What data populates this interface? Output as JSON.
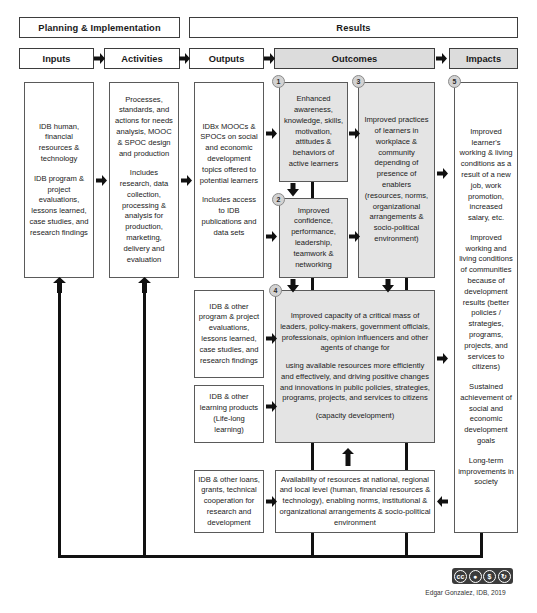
{
  "banners": {
    "planning": "Planning & Implementation",
    "results": "Results"
  },
  "columns": [
    {
      "id": "inputs",
      "label": "Inputs"
    },
    {
      "id": "activities",
      "label": "Activities"
    },
    {
      "id": "outputs",
      "label": "Outputs"
    },
    {
      "id": "outcomes",
      "label": "Outcomes"
    },
    {
      "id": "impacts",
      "label": "Impacts"
    }
  ],
  "inputs": {
    "box1_p1": "IDB human, financial resources & technology",
    "box1_p2": "IDB program & project evaluations, lessons learned, case studies, and research findings"
  },
  "activities": {
    "box1_p1": "Processes, standards, and actions for needs analysis, MOOC & SPOC design and production",
    "box1_p2": "Includes research, data collection, processing & analysis for production, marketing, delivery and evaluation"
  },
  "outputs": {
    "box1_p1": "IDBx MOOCs & SPOCs on social and economic development topics offered to potential learners",
    "box1_p2": "Includes access to IDB publications and data sets",
    "box2": "IDB & other program & project evaluations, lessons learned, case studies, and research findings",
    "box3": "IDB & other learning products (Life-long learning)",
    "box4": "IDB & other loans, grants, technical cooperation for research and development"
  },
  "outcomes": {
    "n1": "1",
    "n2": "2",
    "n3": "3",
    "n4": "4",
    "box1": "Enhanced awareness, knowledge, skills, motivation, attitudes & behaviors of active learners",
    "box2": "Improved confidence, performance, leadership, teamwork & networking",
    "box3": "Improved practices of learners in workplace & community depending of presence of enablers (resources, norms, organizational arrangements & socio-political environment)",
    "box4_p1": "Improved capacity of a critical mass of leaders, policy-makers, government officials, professionals, opinion influencers and other agents of change for",
    "box4_p2": "using available resources more efficiently and effectively, and driving positive changes and innovations in public policies, strategies, programs, projects, and services to citizens",
    "box4_p3": "(capacity development)",
    "box5": "Availability of resources at national, regional and local level (human, financial resources & technology), enabling norms, institutional & organizational arrangements & socio-political environment"
  },
  "impacts": {
    "n5": "5",
    "box1_p1": "Improved learner's working & living conditions as a result of a new job, work promotion, increased salary, etc.",
    "box1_p2": "Improved working and living conditions of communities because of development results (better policies / strategies, programs, projects, and services to citizens)",
    "box1_p3": "Sustained achievement of social and economic development goals",
    "box1_p4": "Long-term improvements in society"
  },
  "footer": {
    "credit": "Edgar Gonzalez, IDB, 2019",
    "license_name": "cc-by-nc-sa-badge",
    "license_marks": [
      "cc",
      "by",
      "nc",
      "sa"
    ]
  },
  "colors": {
    "shade": "#e4e4e4",
    "header_shade": "#dcdcdc",
    "line": "#111111",
    "border": "#5a5a5a"
  }
}
